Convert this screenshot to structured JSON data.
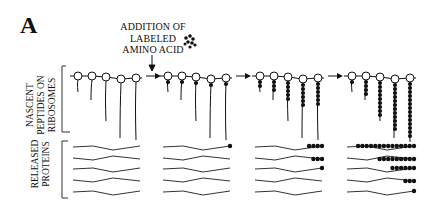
{
  "panel": {
    "letter": "A"
  },
  "annotation": {
    "line1": "ADDITION OF",
    "line2": "LABELED",
    "line3": "AMINO ACID",
    "icon": "labeled-amino-acid-cluster-icon"
  },
  "row_labels": {
    "nascent": {
      "line1": "NASCENT",
      "line2": "PEPTIDES ON",
      "line3": "RIBOSOMES"
    },
    "released": {
      "line1": "RELEASED",
      "line2": "PROTEINS"
    }
  },
  "stages": [
    {
      "index": 1,
      "nascent_labeled_beads": [
        0,
        0,
        0,
        0,
        0
      ],
      "released_labeled_beads": [
        0,
        0,
        0,
        0,
        0
      ]
    },
    {
      "index": 2,
      "nascent_labeled_beads": [
        1,
        1,
        1,
        1,
        1
      ],
      "released_labeled_beads": [
        1,
        0,
        0,
        0,
        0
      ]
    },
    {
      "index": 3,
      "nascent_labeled_beads": [
        2,
        3,
        5,
        6,
        6
      ],
      "released_labeled_beads": [
        4,
        3,
        1,
        0,
        0
      ]
    },
    {
      "index": 4,
      "nascent_labeled_beads": [
        1,
        4,
        9,
        12,
        14
      ],
      "released_labeled_beads": [
        14,
        9,
        6,
        3,
        1
      ]
    }
  ],
  "colors": {
    "ink": "#111111",
    "background": "#ffffff"
  }
}
